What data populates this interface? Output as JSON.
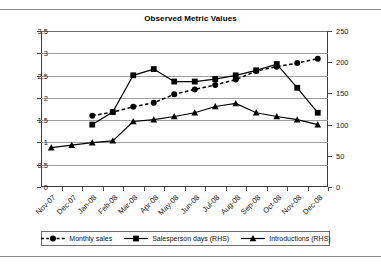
{
  "chart_data": {
    "type": "line",
    "title": "Observed Metric Values",
    "xlabel": "",
    "ylabel": "",
    "ylabel_right": "",
    "grid": true,
    "legend_position": "bottom",
    "categories": [
      "Nov-07",
      "Dec-07",
      "Jan-08",
      "Feb-08",
      "Mar-08",
      "Apr-08",
      "May-08",
      "Jun-08",
      "Jul-08",
      "Aug-08",
      "Sep-08",
      "Oct-08",
      "Nov-08",
      "Dec-08"
    ],
    "ylim": [
      0,
      3.5
    ],
    "yticks": [
      "0",
      "0.5",
      "1",
      "1.5",
      "2",
      "2.5",
      "3",
      "3.5"
    ],
    "ylim_right": [
      0,
      250
    ],
    "yticks_right": [
      "0",
      "50",
      "100",
      "150",
      "200",
      "250"
    ],
    "series": [
      {
        "name": "Monthly sales",
        "axis": "left",
        "marker": "circle",
        "line": "dashed",
        "color": "#000000",
        "values": [
          null,
          null,
          1.6,
          1.68,
          1.8,
          1.89,
          2.08,
          2.19,
          2.29,
          2.41,
          2.6,
          2.7,
          2.78,
          2.88
        ]
      },
      {
        "name": "Salesperson days (RHS)",
        "axis": "right",
        "marker": "square",
        "line": "solid",
        "color": "#000000",
        "values": [
          null,
          null,
          100,
          120,
          179,
          189,
          169,
          169,
          173,
          179,
          187,
          197,
          159,
          119
        ]
      },
      {
        "name": "Introductions (RHS)",
        "axis": "right",
        "marker": "triangle",
        "line": "solid",
        "color": "#000000",
        "values": [
          63,
          67,
          71,
          74,
          105,
          108,
          113,
          119,
          129,
          134,
          119,
          113,
          108,
          100
        ]
      }
    ]
  },
  "legend": {
    "items": [
      {
        "label": "Monthly sales"
      },
      {
        "label": "Salesperson days (RHS)"
      },
      {
        "label": "Introductions (RHS)"
      }
    ]
  }
}
